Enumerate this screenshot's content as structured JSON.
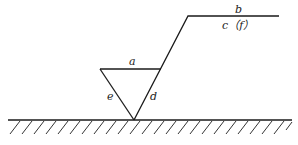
{
  "diagram": {
    "type": "surface-roughness-symbol",
    "labels": {
      "a": "a",
      "b": "b",
      "c": "c（f）",
      "d": "d",
      "e": "e"
    },
    "colors": {
      "stroke": "#1a1a1a",
      "background": "#ffffff"
    }
  }
}
